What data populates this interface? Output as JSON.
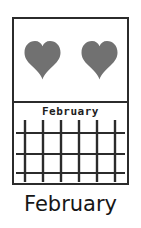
{
  "card": {
    "symbol_panel": {
      "icon_name": "heart-icon",
      "icon_count": 2,
      "icon_color": "#717171"
    },
    "calendar_panel": {
      "month_label": "February",
      "grid": {
        "vertical_lines": 6,
        "horizontal_lines": 3,
        "line_color": "#2b2b2b"
      }
    },
    "border_color": "#2b2b2b",
    "background_color": "#ffffff"
  },
  "caption": {
    "text": "February"
  }
}
